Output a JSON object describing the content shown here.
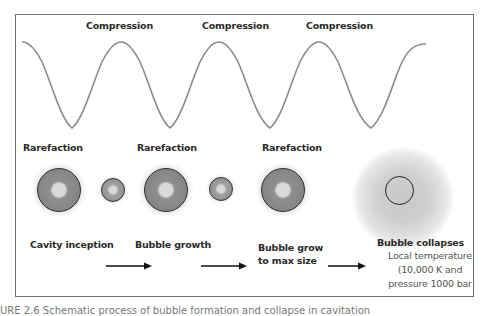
{
  "diagram": {
    "wave_labels": {
      "compression": [
        "Compression",
        "Compression",
        "Compression"
      ],
      "rarefaction": [
        "Rarefaction",
        "Rarefaction",
        "Rarefaction"
      ]
    },
    "stages": [
      {
        "label": "Cavity inception"
      },
      {
        "label": "Bubble growth"
      },
      {
        "label": "Bubble grow\nto max size",
        "line1": "Bubble grow",
        "line2": "to max size"
      },
      {
        "label": "Bubble collapses"
      }
    ],
    "collapse_note": {
      "line1": "Local temperature",
      "line2": "(10,000 K and",
      "line3": "pressure 1000  bar"
    },
    "caption": "URE 2.6 Schematic process of bubble formation and collapse in cavitation",
    "colors": {
      "wave": "#8a8a8a",
      "frame": "#6e6e6e",
      "bubble_fill": "#808080",
      "bubble_core": "#d9d9d9",
      "text": "#2a2a2a"
    }
  }
}
